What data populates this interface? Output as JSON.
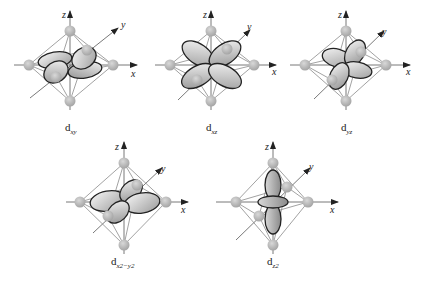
{
  "figure": {
    "colors": {
      "background": "#ffffff",
      "ligand": "#b0b0b0",
      "lobe_fill_light": "#f2f2f2",
      "lobe_fill_dark": "#9a9a9a",
      "edge": "#8a8a8a",
      "outline": "#222222"
    },
    "axis_labels": {
      "x": "x",
      "y": "y",
      "z": "z"
    },
    "panels": [
      {
        "id": "dxy",
        "label_main": "d",
        "label_sub": "xy"
      },
      {
        "id": "dxz",
        "label_main": "d",
        "label_sub": "xz"
      },
      {
        "id": "dyz",
        "label_main": "d",
        "label_sub": "yz"
      },
      {
        "id": "dx2-y2",
        "label_main": "d",
        "label_sub": "x2−y2"
      },
      {
        "id": "dz2",
        "label_main": "d",
        "label_sub": "z2"
      }
    ]
  }
}
